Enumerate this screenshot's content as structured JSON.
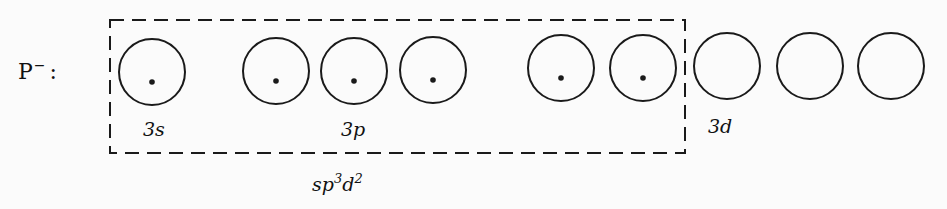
{
  "ion": {
    "symbol": "P",
    "charge": "−",
    "separator": ":"
  },
  "orbitals": [
    {
      "group": "3s",
      "cx": 152,
      "cy": 72,
      "electrons": 1
    },
    {
      "group": "3p",
      "cx": 276,
      "cy": 71,
      "electrons": 1
    },
    {
      "group": "3p",
      "cx": 354,
      "cy": 71,
      "electrons": 1
    },
    {
      "group": "3p",
      "cx": 433,
      "cy": 70,
      "electrons": 1
    },
    {
      "group": "3d",
      "cx": 561,
      "cy": 68,
      "electrons": 1
    },
    {
      "group": "3d",
      "cx": 643,
      "cy": 68,
      "electrons": 1
    },
    {
      "group": "3d",
      "cx": 727,
      "cy": 66,
      "electrons": 0
    },
    {
      "group": "3d",
      "cx": 810,
      "cy": 66,
      "electrons": 0
    },
    {
      "group": "3d",
      "cx": 891,
      "cy": 66,
      "electrons": 0
    }
  ],
  "orbital_radius": 33,
  "labels": {
    "s": "3s",
    "p": "3p",
    "d": "3d"
  },
  "hybrid_box": {
    "x": 110,
    "y": 20,
    "width": 575,
    "height": 133,
    "label_base": "sp",
    "label_exp1": "3",
    "label_mid": "d",
    "label_exp2": "2"
  },
  "colors": {
    "stroke": "#1a1a1a",
    "background": "#fbfbfb"
  }
}
